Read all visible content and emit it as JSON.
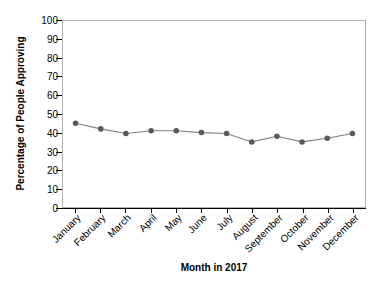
{
  "chart_data": {
    "type": "line",
    "title": "",
    "subtitle": "",
    "xlabel": "Month in 2017",
    "ylabel": "Percentage of People Approving",
    "categories": [
      "January",
      "February",
      "March",
      "April",
      "May",
      "June",
      "July",
      "August",
      "September",
      "October",
      "November",
      "December"
    ],
    "values": [
      45,
      42,
      39.5,
      41,
      41,
      40,
      39.5,
      35,
      38,
      35,
      37,
      39.5
    ],
    "series": [
      {
        "name": "Percentage of People Approving",
        "values": [
          45,
          42,
          39.5,
          41,
          41,
          40,
          39.5,
          35,
          38,
          35,
          37,
          39.5
        ]
      }
    ],
    "ylim": [
      0,
      100
    ],
    "ytick_values": [
      0,
      10,
      20,
      30,
      40,
      50,
      60,
      70,
      80,
      90,
      100
    ],
    "ytick_labels": [
      "0",
      "10",
      "20",
      "30",
      "40",
      "50",
      "60",
      "70",
      "80",
      "90",
      "100"
    ],
    "xtick_labels": [
      "January",
      "February",
      "March",
      "April",
      "May",
      "June",
      "July",
      "August",
      "September",
      "October",
      "November",
      "December"
    ],
    "grid": false,
    "legend": false,
    "legend_position": "none",
    "marker": "circle",
    "line_color": "#808080",
    "marker_color": "#595959",
    "axis_color": "#000000",
    "plot_border_color": "#b3b3b3",
    "background_color": "#ffffff",
    "xlabel_rotation": -45
  }
}
